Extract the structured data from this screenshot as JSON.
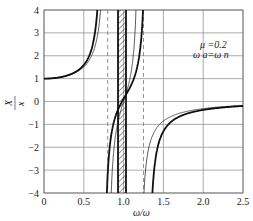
{
  "chart_data": {
    "type": "line",
    "title": "",
    "xlabel": "ω/ω_n",
    "ylabel": "X1/Xst",
    "xlim": [
      0,
      2.5
    ],
    "ylim": [
      -4,
      4
    ],
    "xticks": [
      "0",
      "0.5",
      "1.0",
      "1.5",
      "2.0",
      "2.5"
    ],
    "yticks": [
      "4",
      "3",
      "2",
      "1",
      "0",
      "-1",
      "-2",
      "-3",
      "-4"
    ],
    "grid": true,
    "annotation": [
      "μ=0.2",
      "ωa=ωn"
    ],
    "series": [
      {
        "name": "with absorber (thick)",
        "style": "thick",
        "resonances": [
          0.74,
          1.3
        ],
        "antiresonance": 0.98
      },
      {
        "name": "with absorber (thin)",
        "style": "thin",
        "resonances": [
          0.79,
          1.2
        ],
        "antiresonance": 1.0
      }
    ],
    "dashed_lines_x": [
      0.8,
      1.25
    ],
    "shaded_band": [
      0.93,
      1.02
    ],
    "thick_band_edges": [
      0.93,
      1.03
    ]
  },
  "labels": {
    "annot1": "μ =0.2",
    "annot2": "ω a=ω n",
    "xlabel": "ω/ω",
    "xlabel_sub": "n",
    "ylabel_num": "X",
    "ylabel_num_sub": "1",
    "ylabel_den": "x",
    "ylabel_den_sub": "st"
  }
}
